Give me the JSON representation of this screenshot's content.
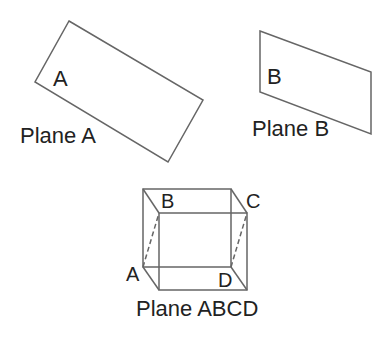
{
  "diagram": {
    "colors": {
      "stroke": "#666666",
      "text": "#222222",
      "background": "#ffffff"
    },
    "plane_a": {
      "inner_label": "A",
      "caption": "Plane A",
      "shape": "rotated-rectangle",
      "points": [
        [
          69,
          21
        ],
        [
          203,
          100
        ],
        [
          168,
          162
        ],
        [
          35,
          82
        ]
      ]
    },
    "plane_b": {
      "inner_label": "B",
      "caption": "Plane B",
      "shape": "parallelogram",
      "points": [
        [
          260,
          31
        ],
        [
          371,
          72
        ],
        [
          371,
          134
        ],
        [
          260,
          92
        ]
      ]
    },
    "plane_abcd": {
      "caption": "Plane ABCD",
      "vertices": {
        "A": "A",
        "B": "B",
        "C": "C",
        "D": "D"
      },
      "cube": {
        "back": [
          [
            143,
            189
          ],
          [
            231,
            189
          ],
          [
            231,
            267
          ],
          [
            143,
            267
          ]
        ],
        "front": [
          [
            159,
            213
          ],
          [
            247,
            213
          ],
          [
            247,
            290
          ],
          [
            159,
            290
          ]
        ]
      },
      "dashed_edges": [
        {
          "from": "A",
          "to": "B"
        },
        {
          "from": "D",
          "to": "C"
        }
      ]
    }
  }
}
